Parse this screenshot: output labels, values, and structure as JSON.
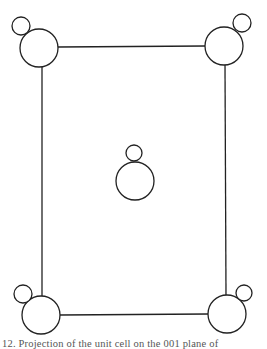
{
  "figure": {
    "title": "Projection of the unit cell on the 001 plane",
    "stroke_color": "#222222",
    "background": "#ffffff",
    "cell_edges": [
      {
        "x1": 58,
        "y1": 47,
        "x2": 205,
        "y2": 46
      },
      {
        "x1": 42,
        "y1": 67,
        "x2": 42,
        "y2": 296
      },
      {
        "x1": 225,
        "y1": 65,
        "x2": 226,
        "y2": 295
      },
      {
        "x1": 60,
        "y1": 315,
        "x2": 208,
        "y2": 314
      }
    ],
    "atoms": [
      {
        "position": "top-left",
        "large": {
          "cx": 39,
          "cy": 48,
          "r": 19
        },
        "small": {
          "cx": 21,
          "cy": 26,
          "r": 9
        }
      },
      {
        "position": "top-right",
        "large": {
          "cx": 224,
          "cy": 46,
          "r": 19
        },
        "small": {
          "cx": 242,
          "cy": 23,
          "r": 9
        }
      },
      {
        "position": "center",
        "large": {
          "cx": 135,
          "cy": 181,
          "r": 19
        },
        "small": {
          "cx": 134,
          "cy": 153,
          "r": 8
        }
      },
      {
        "position": "bottom-left",
        "large": {
          "cx": 41,
          "cy": 315,
          "r": 19
        },
        "small": {
          "cx": 23,
          "cy": 294,
          "r": 9
        }
      },
      {
        "position": "bottom-right",
        "large": {
          "cx": 227,
          "cy": 314,
          "r": 19
        },
        "small": {
          "cx": 244,
          "cy": 293,
          "r": 8
        }
      }
    ]
  },
  "caption": {
    "text": "12.  Projection of the unit cell on the 001 plane of"
  }
}
